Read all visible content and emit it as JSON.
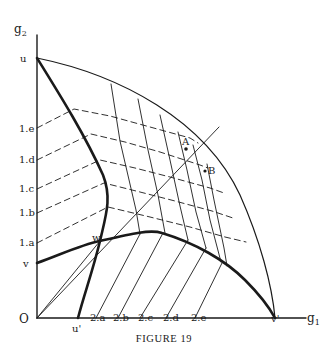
{
  "figure": {
    "caption": "FIGURE 19",
    "axes": {
      "y_label": "g",
      "y_label_sub": "2",
      "x_label": "g",
      "x_label_sub": "1",
      "origin_label": "O"
    },
    "y_axis_labels": {
      "u": "u",
      "e": "1.e",
      "d": "1.d",
      "c": "1.c",
      "b": "1.b",
      "a": "1.a",
      "v": "v"
    },
    "x_axis_labels": {
      "u_prime": "u'",
      "a": "2.a",
      "b": "2.b",
      "c": "2.c",
      "d": "2.d",
      "e": "2.e",
      "v_prime": "v'"
    },
    "points": {
      "w": "w",
      "A": "A",
      "B": "B"
    },
    "colors": {
      "ink": "#1a1a1a",
      "background": "#ffffff"
    }
  }
}
